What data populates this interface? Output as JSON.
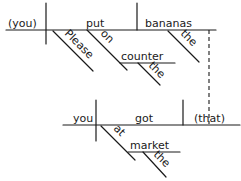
{
  "diagram": {
    "type": "sentence-diagram",
    "main_clause": {
      "subject": "(you)",
      "verb": "put",
      "direct_object": "bananas",
      "modifiers": {
        "verb_adverb": "Please",
        "preposition": "on",
        "prep_object": "counter",
        "prep_object_article": "the",
        "object_article": "the"
      }
    },
    "relative_clause": {
      "subject": "you",
      "verb": "got",
      "direct_object": "(that)",
      "modifiers": {
        "preposition": "at",
        "prep_object": "market",
        "prep_object_article": "the"
      }
    },
    "colors": {
      "ink": "#1a1a1a",
      "background": "#ffffff"
    }
  }
}
